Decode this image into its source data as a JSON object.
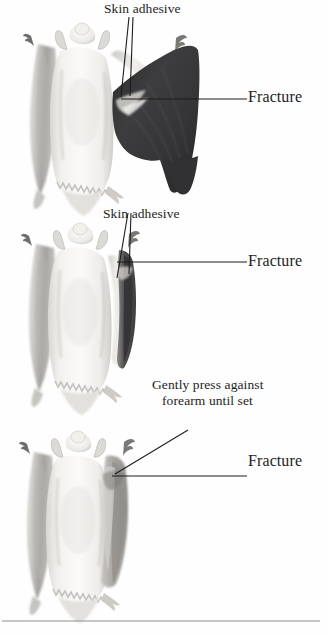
{
  "figure": {
    "panel_count": 3,
    "style": "grayscale anatomical illustration",
    "bottom_rule_color": "#8e8e8e",
    "background_color": "#ffffff",
    "ink_color": "#1d1d1d"
  },
  "panels": [
    {
      "id": "panel-1",
      "name": "wing-extended-fracture",
      "description": "Dorsal view of bat with right wing membrane fully extended showing fracture site",
      "labels": {
        "adhesive": "Skin adhesive",
        "fracture": "Fracture"
      },
      "leader_lines": 3,
      "wing_fill": "#3a3a3c"
    },
    {
      "id": "panel-2",
      "name": "wing-folded-adhesive-applied",
      "description": "Dorsal view of bat with wing membrane partially folded, adhesive applied at fracture",
      "labels": {
        "adhesive": "Skin adhesive",
        "fracture": "Fracture"
      },
      "leader_lines": 3,
      "wing_fill": "#4a4a4d"
    },
    {
      "id": "panel-3",
      "name": "wing-pressed-against-forearm",
      "description": "Dorsal view of bat with wing fully closed and pressed against forearm until adhesive sets",
      "labels": {
        "caption_line_1": "Gently press against",
        "caption_line_2": "forearm until set",
        "fracture": "Fracture"
      },
      "leader_lines": 2,
      "wing_fill": "#9b9a97"
    }
  ],
  "colors": {
    "body_light": "#f6f5f3",
    "body_shade": "#cfcdc9",
    "body_shade_deep": "#a9a7a3",
    "wing_dark": "#3a3a3c",
    "wing_mid": "#6d6c6b",
    "wing_light": "#b9b7b3",
    "outline": "#7a7874",
    "leader": "#1d1d1d"
  }
}
